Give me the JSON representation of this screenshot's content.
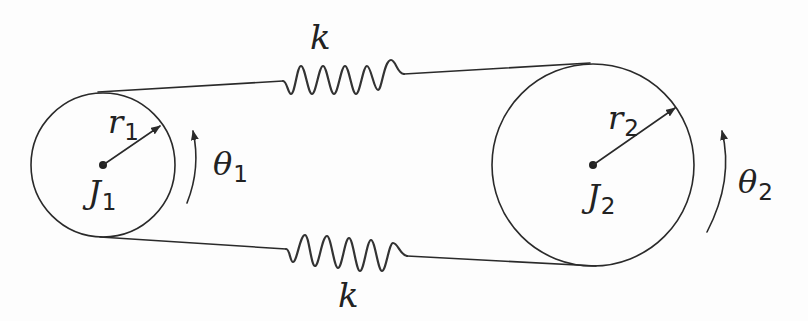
{
  "diagram": {
    "pulleys": [
      {
        "id": "pulley-1",
        "inertia_label": "J",
        "inertia_sub": "1",
        "radius_label": "r",
        "radius_sub": "1",
        "angle_label": "θ",
        "angle_sub": "1",
        "center": [
          103,
          165
        ],
        "radius": 72
      },
      {
        "id": "pulley-2",
        "inertia_label": "J",
        "inertia_sub": "2",
        "radius_label": "r",
        "radius_sub": "2",
        "angle_label": "θ",
        "angle_sub": "2",
        "center": [
          593,
          165
        ],
        "radius": 101
      }
    ],
    "springs": [
      {
        "id": "top-spring",
        "label": "k",
        "position": "top"
      },
      {
        "id": "bottom-spring",
        "label": "k",
        "position": "bottom"
      }
    ],
    "colors": {
      "line": "#2a2a2a",
      "text": "#222222",
      "background": "#fdfdfd"
    }
  }
}
